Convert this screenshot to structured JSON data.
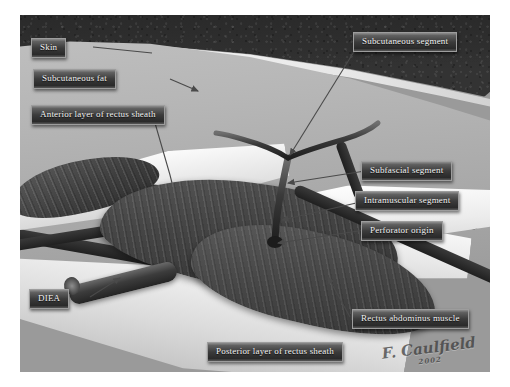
{
  "figure": {
    "signature": "F. Caulfield",
    "signature_sub": "2002",
    "palette": {
      "skin": "#2e2e2e",
      "subcutaneous_fat": "#b2b2b2",
      "fascia_sheath": "#efefef",
      "muscle": "#454545",
      "vessel": "#3c3c3c",
      "label_bg": "#3b3b3b",
      "label_border": "#9d9d9d",
      "label_text": "#f2f2f2",
      "background": "#ffffff"
    }
  },
  "labels": [
    {
      "id": "skin",
      "text": "Skin",
      "name": "label-skin"
    },
    {
      "id": "subcutaneous_fat",
      "text": "Subcutaneous fat",
      "name": "label-subcutaneous-fat"
    },
    {
      "id": "anterior_sheath",
      "text": "Anterior layer of rectus sheath",
      "name": "label-anterior-layer-of-rectus-sheath"
    },
    {
      "id": "subcutaneous_segment",
      "text": "Subcutaneous segment",
      "name": "label-subcutaneous-segment"
    },
    {
      "id": "subfascial_segment",
      "text": "Subfascial segment",
      "name": "label-subfascial-segment"
    },
    {
      "id": "intramuscular_segment",
      "text": "Intramuscular segment",
      "name": "label-intramuscular-segment"
    },
    {
      "id": "perforator_origin",
      "text": "Perforator origin",
      "name": "label-perforator-origin"
    },
    {
      "id": "diea",
      "text": "DIEA",
      "name": "label-diea"
    },
    {
      "id": "rectus_muscle",
      "text": "Rectus abdominus muscle",
      "name": "label-rectus-abdominus-muscle"
    },
    {
      "id": "posterior_sheath",
      "text": "Posterior layer of rectus sheath",
      "name": "label-posterior-layer-of-rectus-sheath"
    }
  ],
  "structures": [
    {
      "id": "skin_layer",
      "name": "skin-layer"
    },
    {
      "id": "fat_layer",
      "name": "subcutaneous-fat-layer"
    },
    {
      "id": "anterior_sheath",
      "name": "anterior-rectus-sheath"
    },
    {
      "id": "posterior_sheath",
      "name": "posterior-rectus-sheath"
    },
    {
      "id": "rectus_muscle",
      "name": "rectus-abdominus-muscle"
    },
    {
      "id": "perforator",
      "name": "perforator-vessel"
    },
    {
      "id": "diea_vessel",
      "name": "diea-vessel"
    }
  ]
}
